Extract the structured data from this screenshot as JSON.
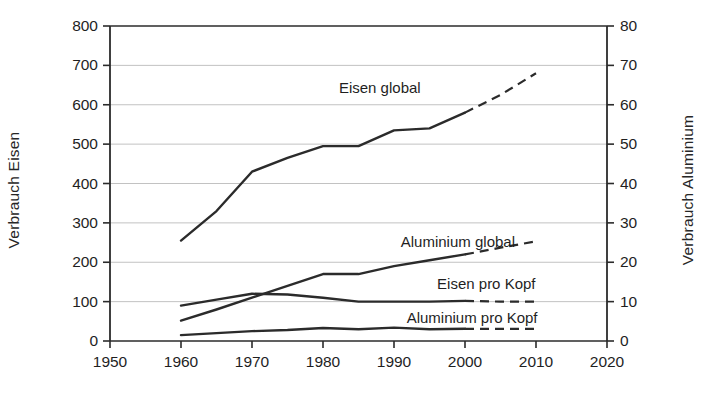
{
  "chart_data": {
    "type": "line",
    "title": "",
    "xlabel": "",
    "ylabel": "Verbrauch Eisen",
    "y2label": "Verbrauch Aluminium",
    "xlim": [
      1950,
      2020
    ],
    "ylim": [
      0,
      800
    ],
    "y2lim": [
      0,
      80
    ],
    "xticks": [
      1950,
      1960,
      1970,
      1980,
      1990,
      2000,
      2010,
      2020
    ],
    "xtick_labels": [
      "1950",
      "1960",
      "1970",
      "1980",
      "1990",
      "2000",
      "2010",
      "2020"
    ],
    "yticks": [
      0,
      100,
      200,
      300,
      400,
      500,
      600,
      700,
      800
    ],
    "ytick_labels": [
      "0",
      "100",
      "200",
      "300",
      "400",
      "500",
      "600",
      "700",
      "800"
    ],
    "y2ticks": [
      0,
      10,
      20,
      30,
      40,
      50,
      60,
      70,
      80
    ],
    "y2tick_labels": [
      "0",
      "10",
      "20",
      "30",
      "40",
      "50",
      "60",
      "70",
      "80"
    ],
    "grid": true,
    "grid_axis": "y",
    "legend_position": "inline-annotations",
    "line_color": "#2b2b2b",
    "grid_color": "#b3b3b3",
    "axis_color": "#2b2b2b",
    "series": [
      {
        "name": "Eisen global",
        "axis": "left",
        "label_text": "Eisen global",
        "label_x": 1988,
        "label_y": 645,
        "solid": {
          "x": [
            1960,
            1965,
            1970,
            1975,
            1980,
            1985,
            1990,
            1995,
            2000
          ],
          "y": [
            255,
            330,
            430,
            465,
            495,
            495,
            535,
            540,
            580
          ]
        },
        "dashed": {
          "x": [
            2000,
            2005,
            2010
          ],
          "y": [
            580,
            625,
            680
          ]
        }
      },
      {
        "name": "Aluminium global",
        "axis": "left",
        "label_text": "Aluminium global",
        "label_x": 1999,
        "label_y": 255,
        "solid": {
          "x": [
            1960,
            1965,
            1970,
            1975,
            1980,
            1985,
            1990,
            1995,
            2000
          ],
          "y": [
            52,
            80,
            110,
            140,
            170,
            170,
            190,
            205,
            220
          ]
        },
        "dashed": {
          "x": [
            2000,
            2005,
            2010
          ],
          "y": [
            220,
            237,
            253
          ]
        }
      },
      {
        "name": "Eisen pro Kopf",
        "axis": "left",
        "label_text": "Eisen pro Kopf",
        "label_x": 2003,
        "label_y": 148,
        "solid": {
          "x": [
            1960,
            1965,
            1970,
            1975,
            1980,
            1985,
            1990,
            1995,
            2000
          ],
          "y": [
            90,
            105,
            120,
            118,
            110,
            100,
            100,
            100,
            102
          ]
        },
        "dashed": {
          "x": [
            2000,
            2005,
            2010
          ],
          "y": [
            102,
            100,
            100
          ]
        }
      },
      {
        "name": "Aluminium pro Kopf",
        "axis": "left",
        "label_text": "Aluminium pro Kopf",
        "label_x": 2001,
        "label_y": 62,
        "solid": {
          "x": [
            1960,
            1965,
            1970,
            1975,
            1980,
            1985,
            1990,
            1995,
            2000
          ],
          "y": [
            15,
            20,
            25,
            28,
            33,
            30,
            34,
            30,
            31
          ]
        },
        "dashed": {
          "x": [
            2000,
            2005,
            2010
          ],
          "y": [
            31,
            31,
            31
          ]
        }
      }
    ]
  }
}
